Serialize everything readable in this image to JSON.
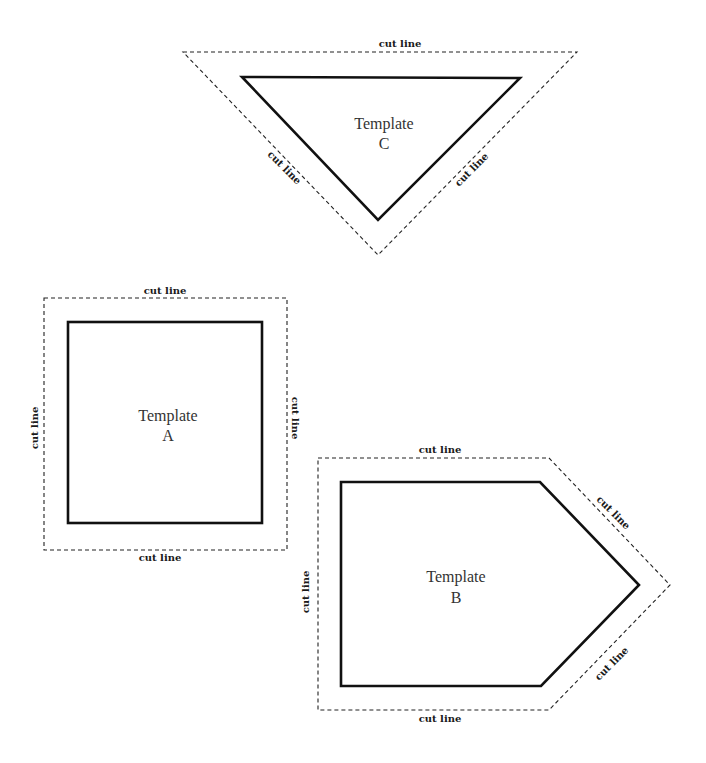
{
  "colors": {
    "background": "#ffffff",
    "outline": "#111111",
    "text": "#333333"
  },
  "templates": {
    "a": {
      "title": "Template",
      "letter": "A",
      "shape": "square",
      "cut_labels": {
        "top": "cut line",
        "bottom": "cut line",
        "left": "cut line",
        "right": "cut line"
      }
    },
    "b": {
      "title": "Template",
      "letter": "B",
      "shape": "pentagon",
      "cut_labels": {
        "top": "cut line",
        "bottom": "cut line",
        "left": "cut line",
        "upper_right": "cut line",
        "lower_right": "cut line"
      }
    },
    "c": {
      "title": "Template",
      "letter": "C",
      "shape": "triangle",
      "cut_labels": {
        "top": "cut line",
        "left": "cut line",
        "right": "cut line"
      }
    }
  }
}
